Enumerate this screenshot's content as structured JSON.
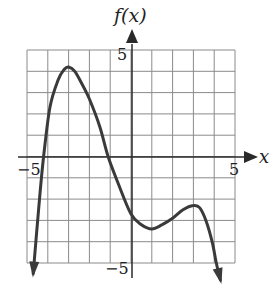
{
  "chart_data": {
    "type": "line",
    "title": "",
    "xlabel": "x",
    "ylabel": "f(x)",
    "xlim": [
      -5,
      5
    ],
    "ylim": [
      -5,
      5
    ],
    "grid": true,
    "grid_step": 1,
    "tick_labels": {
      "x_min": "−5",
      "x_max": "5",
      "y_max": "5",
      "y_min": "−5"
    },
    "series": [
      {
        "name": "f(x)",
        "x": [
          -4.7,
          -4.4,
          -4.2,
          -3.9,
          -3.5,
          -3.2,
          -3.0,
          -2.7,
          -2.3,
          -2.0,
          -1.5,
          -1.1,
          -0.6,
          0.0,
          0.5,
          1.0,
          1.5,
          2.0,
          2.5,
          3.0,
          3.3,
          3.6,
          3.9,
          4.1,
          4.3
        ],
        "y": [
          -5.5,
          -2.0,
          0.0,
          2.3,
          3.6,
          4.1,
          4.2,
          4.0,
          3.3,
          2.7,
          1.4,
          0.0,
          -1.3,
          -2.7,
          -3.2,
          -3.4,
          -3.2,
          -2.9,
          -2.5,
          -2.3,
          -2.4,
          -3.0,
          -4.0,
          -5.0,
          -5.8
        ]
      }
    ],
    "annotations": {
      "end_behavior": "both ends point downward (arrows)",
      "x_intercepts_approx": [
        -4.2,
        -1.1
      ],
      "local_max": [
        {
          "x": -3,
          "y": 4.2
        },
        {
          "x": 3,
          "y": -2.3
        }
      ],
      "local_min": [
        {
          "x": 1,
          "y": -3.4
        }
      ]
    }
  },
  "labels": {
    "y_axis_title": "f(x)",
    "x_axis_title": "x",
    "x_tick_min": "−5",
    "x_tick_max": "5",
    "y_tick_max": "5",
    "y_tick_min": "−5"
  },
  "colors": {
    "curve": "#3a3a3a",
    "grid": "#8a8a8a",
    "axis": "#2a2a2a",
    "background": "#ffffff"
  }
}
